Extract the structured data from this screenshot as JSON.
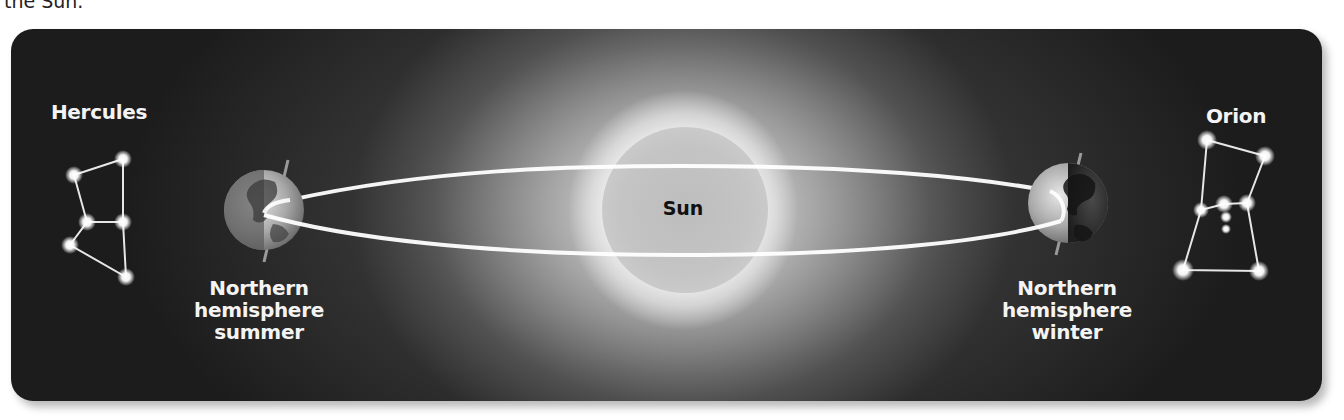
{
  "caption_fragment": "the Sun.",
  "diagram": {
    "sun": {
      "label": "Sun"
    },
    "constellations": {
      "left": {
        "name": "Hercules"
      },
      "right": {
        "name": "Orion"
      }
    },
    "earth_positions": {
      "left": {
        "line1": "Northern",
        "line2": "hemisphere",
        "line3": "summer"
      },
      "right": {
        "line1": "Northern",
        "line2": "hemisphere",
        "line3": "winter"
      }
    }
  },
  "colors": {
    "panel_background": "#1c1c1c",
    "orbit_line": "#ffffff",
    "label_text": "#f4f4f4",
    "sun_label_text": "#111111"
  }
}
